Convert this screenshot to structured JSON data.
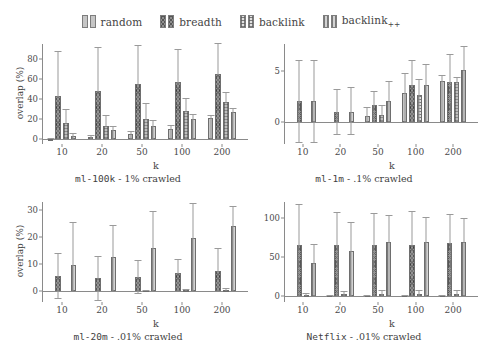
{
  "legend": {
    "entries": [
      {
        "label": "random",
        "key": "random",
        "pattern": "p-random"
      },
      {
        "label": "breadth",
        "key": "breadth",
        "pattern": "p-breadth"
      },
      {
        "label": "backlink",
        "key": "backlink",
        "pattern": "p-backlink"
      },
      {
        "label": "backlink++",
        "key": "backlinkpp",
        "pattern": "p-backlinkpp"
      }
    ]
  },
  "colors": {
    "random": "#c6c6c6",
    "breadth": "#8f8f8f",
    "backlink": "#e2e2e2",
    "backlinkpp": "#d2d2d2",
    "axis": "#8a8a8a",
    "error_bar": "#9a9a9a",
    "text": "#3f3f3f"
  },
  "chart_data": [
    {
      "id": "ml-100k",
      "type": "bar",
      "title": "ml-100k - 1% crawled",
      "title_mono": "ml-100k",
      "title_rest": " - 1% crawled",
      "xlabel": "k",
      "ylabel": "overlap (%)",
      "categories": [
        "10",
        "20",
        "50",
        "100",
        "200"
      ],
      "ylim": [
        -5,
        95
      ],
      "yticks": [
        0,
        20,
        40,
        60,
        80
      ],
      "grid": false,
      "legend_position": "top-shared",
      "series": [
        {
          "name": "random",
          "values": [
            0.3,
            1.8,
            5.0,
            10.5,
            21.0
          ],
          "err_low": [
            0.0,
            0.0,
            2.0,
            7.0,
            17.0
          ],
          "err_high": [
            1.5,
            4.0,
            8.5,
            14.5,
            24.5
          ]
        },
        {
          "name": "breadth",
          "values": [
            43.5,
            48.0,
            55.0,
            57.0,
            65.5
          ],
          "err_low": [
            0.0,
            0.0,
            0.0,
            0.0,
            0.0
          ],
          "err_high": [
            88.0,
            92.0,
            94.0,
            90.0,
            96.0
          ]
        },
        {
          "name": "backlink",
          "values": [
            16.0,
            13.0,
            20.0,
            28.0,
            37.5
          ],
          "err_low": [
            3.5,
            4.0,
            8.0,
            16.0,
            28.0
          ],
          "err_high": [
            30.0,
            24.0,
            36.0,
            41.0,
            47.0
          ]
        },
        {
          "name": "backlink++",
          "values": [
            3.5,
            9.0,
            13.5,
            20.0,
            27.0
          ],
          "err_low": [
            1.5,
            5.0,
            8.0,
            15.0,
            22.0
          ],
          "err_high": [
            6.0,
            13.0,
            19.0,
            25.0,
            31.0
          ]
        }
      ]
    },
    {
      "id": "ml-1m",
      "type": "bar",
      "title": "ml-1m - .1% crawled",
      "title_mono": "ml-1m",
      "title_rest": " - .1% crawled",
      "xlabel": "k",
      "ylabel": "",
      "categories": [
        "10",
        "20",
        "50",
        "100",
        "200"
      ],
      "ylim": [
        -2.2,
        7.6
      ],
      "yticks": [
        0,
        5
      ],
      "grid": false,
      "legend_position": "top-shared",
      "series": [
        {
          "name": "random",
          "values": [
            0.0,
            0.0,
            0.5,
            2.8,
            4.0
          ],
          "err_low": [
            0.0,
            0.0,
            0.0,
            0.0,
            0.0
          ],
          "err_high": [
            0.0,
            0.0,
            1.4,
            4.8,
            4.6
          ]
        },
        {
          "name": "breadth",
          "values": [
            2.0,
            0.9,
            1.6,
            3.6,
            3.9
          ],
          "err_low": [
            -2.0,
            -1.2,
            0.0,
            0.0,
            0.0
          ],
          "err_high": [
            6.0,
            3.2,
            3.0,
            6.0,
            6.6
          ]
        },
        {
          "name": "backlink",
          "values": [
            0.0,
            0.0,
            0.65,
            2.6,
            3.9
          ],
          "err_low": [
            0.0,
            0.0,
            0.0,
            0.0,
            0.0
          ],
          "err_high": [
            0.0,
            0.0,
            1.6,
            4.2,
            4.4
          ]
        },
        {
          "name": "backlink++",
          "values": [
            2.0,
            0.9,
            2.0,
            3.6,
            5.1
          ],
          "err_low": [
            -2.0,
            -1.2,
            0.0,
            0.0,
            0.0
          ],
          "err_high": [
            6.0,
            3.4,
            4.0,
            5.6,
            7.4
          ]
        }
      ]
    },
    {
      "id": "ml-20m",
      "type": "bar",
      "title": "ml-20m - .01% crawled",
      "title_mono": "ml-20m",
      "title_rest": " - .01% crawled",
      "xlabel": "k",
      "ylabel": "overlap (%)",
      "categories": [
        "10",
        "20",
        "50",
        "100",
        "200"
      ],
      "ylim": [
        -4,
        33
      ],
      "yticks": [
        0,
        10,
        20,
        30
      ],
      "grid": false,
      "legend_position": "top-shared",
      "series": [
        {
          "name": "random",
          "values": [
            0.0,
            0.0,
            0.0,
            0.0,
            0.0
          ],
          "err_low": [
            0.0,
            0.0,
            0.0,
            0.0,
            0.0
          ],
          "err_high": [
            0.0,
            0.0,
            0.0,
            0.0,
            0.0
          ]
        },
        {
          "name": "breadth",
          "values": [
            5.8,
            4.9,
            5.4,
            6.6,
            7.3
          ],
          "err_low": [
            -2.6,
            -3.2,
            -0.8,
            0.0,
            0.0
          ],
          "err_high": [
            14.0,
            13.0,
            11.5,
            12.0,
            16.0
          ]
        },
        {
          "name": "backlink",
          "values": [
            0.0,
            0.0,
            0.3,
            0.4,
            0.6
          ],
          "err_low": [
            0.0,
            0.0,
            0.0,
            0.0,
            0.0
          ],
          "err_high": [
            0.0,
            0.0,
            0.5,
            0.9,
            1.1
          ]
        },
        {
          "name": "backlink++",
          "values": [
            9.7,
            12.6,
            16.1,
            19.7,
            24.2
          ],
          "err_low": [
            0.0,
            0.0,
            0.0,
            0.0,
            0.0
          ],
          "err_high": [
            25.5,
            24.5,
            29.5,
            32.5,
            31.5
          ]
        }
      ]
    },
    {
      "id": "netflix",
      "type": "bar",
      "title": "Netflix - .01% crawled",
      "title_mono": "Netflix",
      "title_rest": " - .01% crawled",
      "xlabel": "k",
      "ylabel": "",
      "categories": [
        "10",
        "20",
        "50",
        "100",
        "200"
      ],
      "ylim": [
        -8,
        120
      ],
      "yticks": [
        0,
        50,
        100
      ],
      "grid": false,
      "legend_position": "top-shared",
      "series": [
        {
          "name": "random",
          "values": [
            0.0,
            0.6,
            0.8,
            0.9,
            1.2
          ],
          "err_low": [
            0.0,
            0.0,
            0.0,
            0.0,
            0.0
          ],
          "err_high": [
            0.0,
            0.8,
            1.0,
            1.2,
            1.6
          ]
        },
        {
          "name": "breadth",
          "values": [
            65.0,
            65.0,
            65.0,
            64.5,
            67.0
          ],
          "err_low": [
            0.0,
            0.0,
            0.0,
            0.0,
            0.0
          ],
          "err_high": [
            118.0,
            107.0,
            106.0,
            108.0,
            105.0
          ]
        },
        {
          "name": "backlink",
          "values": [
            1.5,
            2.5,
            2.5,
            2.0,
            2.5
          ],
          "err_low": [
            0.0,
            0.0,
            0.0,
            0.0,
            0.0
          ],
          "err_high": [
            4.0,
            6.0,
            7.5,
            7.0,
            7.5
          ]
        },
        {
          "name": "backlink++",
          "values": [
            42.0,
            57.5,
            69.0,
            68.5,
            68.5
          ],
          "err_low": [
            0.0,
            0.0,
            0.0,
            0.0,
            0.0
          ],
          "err_high": [
            66.0,
            95.0,
            104.0,
            101.0,
            99.0
          ]
        }
      ]
    }
  ]
}
